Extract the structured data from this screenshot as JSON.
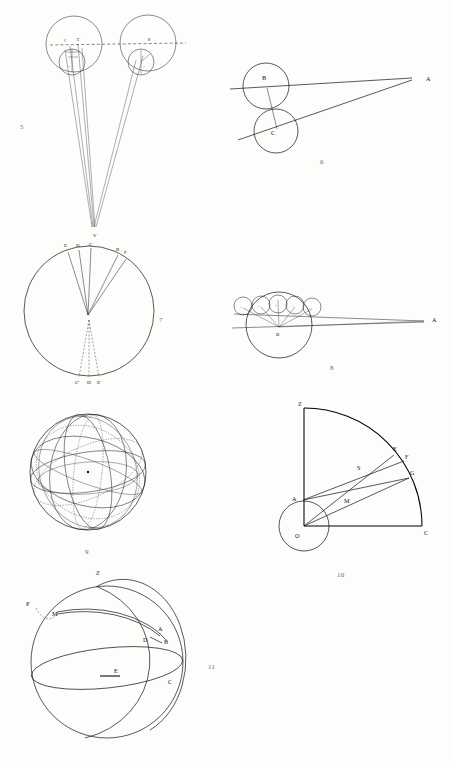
{
  "page": {
    "background_color": "#fdfdfb",
    "ink_color": "#111111",
    "width": 451,
    "height": 761
  },
  "figures": [
    {
      "number": "5",
      "caption": "5",
      "type": "two-epicycle-circles-with-converging-sight-lines",
      "labels": [
        "C",
        "E'",
        "B",
        "D",
        "A"
      ],
      "label_points": [
        {
          "text": "C",
          "x": 65,
          "y": 41
        },
        {
          "text": "E'",
          "x": 79,
          "y": 40
        },
        {
          "text": "B",
          "x": 150,
          "y": 40
        },
        {
          "text": "D",
          "x": 70,
          "y": 66
        },
        {
          "text": "D",
          "x": 145,
          "y": 66
        },
        {
          "text": "A",
          "x": 92,
          "y": 225
        }
      ]
    },
    {
      "number": "6",
      "caption": "6",
      "type": "two-tangent-circles-with-lines-to-external-point",
      "labels": [
        "B",
        "C",
        "A"
      ],
      "label_points": [
        {
          "text": "B",
          "x": 265,
          "y": 78
        },
        {
          "text": "C",
          "x": 274,
          "y": 132
        },
        {
          "text": "A",
          "x": 429,
          "y": 81
        }
      ]
    },
    {
      "number": "7",
      "caption": "7",
      "type": "circle-with-chords-from-interior-point",
      "labels": [
        "V",
        "E",
        "D",
        "C",
        "B",
        "F",
        "C'",
        "D'",
        "E'"
      ],
      "label_points": [
        {
          "text": "V",
          "x": 96,
          "y": 234
        },
        {
          "text": "E",
          "x": 67,
          "y": 246
        },
        {
          "text": "D",
          "x": 79,
          "y": 246
        },
        {
          "text": "C",
          "x": 92,
          "y": 245
        },
        {
          "text": "B",
          "x": 119,
          "y": 250
        },
        {
          "text": "F",
          "x": 127,
          "y": 253
        },
        {
          "text": "C'",
          "x": 78,
          "y": 382
        },
        {
          "text": "D'",
          "x": 90,
          "y": 382
        },
        {
          "text": "E'",
          "x": 100,
          "y": 382
        }
      ]
    },
    {
      "number": "8",
      "caption": "8",
      "type": "large-circle-with-five-small-circles-and-sight-lines",
      "labels": [
        "H",
        "G",
        "D",
        "F",
        "E",
        "B",
        "A"
      ],
      "label_points": [
        {
          "text": "H",
          "x": 240,
          "y": 306
        },
        {
          "text": "G",
          "x": 258,
          "y": 306
        },
        {
          "text": "D",
          "x": 274,
          "y": 306
        },
        {
          "text": "F",
          "x": 290,
          "y": 306
        },
        {
          "text": "E",
          "x": 306,
          "y": 306
        },
        {
          "text": "B",
          "x": 280,
          "y": 332
        },
        {
          "text": "A",
          "x": 434,
          "y": 320
        }
      ]
    },
    {
      "number": "9",
      "caption": "9",
      "type": "armillary-sphere-with-multiple-great-circles",
      "labels": [],
      "label_points": []
    },
    {
      "number": "10",
      "caption": "10",
      "type": "quadrant-with-radii-and-small-circle",
      "labels": [
        "Z",
        "E",
        "F",
        "G",
        "S",
        "A",
        "M",
        "O",
        "C"
      ],
      "label_points": [
        {
          "text": "Z",
          "x": 300,
          "y": 404
        },
        {
          "text": "E",
          "x": 396,
          "y": 449
        },
        {
          "text": "F",
          "x": 408,
          "y": 456
        },
        {
          "text": "G",
          "x": 412,
          "y": 472
        },
        {
          "text": "S",
          "x": 360,
          "y": 467
        },
        {
          "text": "A",
          "x": 294,
          "y": 498
        },
        {
          "text": "M",
          "x": 347,
          "y": 500
        },
        {
          "text": "O",
          "x": 296,
          "y": 536
        },
        {
          "text": "C",
          "x": 424,
          "y": 536
        }
      ]
    },
    {
      "number": "11",
      "caption": "11",
      "type": "celestial-sphere-with-horizon-meridian-and-arcs",
      "labels": [
        "Z",
        "P",
        "M",
        "A",
        "B",
        "D",
        "C",
        "E"
      ],
      "label_points": [
        {
          "text": "Z",
          "x": 99,
          "y": 573
        },
        {
          "text": "P",
          "x": 29,
          "y": 604
        },
        {
          "text": "M",
          "x": 55,
          "y": 613
        },
        {
          "text": "A",
          "x": 160,
          "y": 629
        },
        {
          "text": "B",
          "x": 166,
          "y": 641
        },
        {
          "text": "D",
          "x": 146,
          "y": 639
        },
        {
          "text": "C",
          "x": 170,
          "y": 682
        },
        {
          "text": "E",
          "x": 117,
          "y": 677
        }
      ]
    }
  ],
  "figure_numbers": [
    {
      "text": "5",
      "x": 20,
      "y": 123
    },
    {
      "text": "6",
      "x": 320,
      "y": 158
    },
    {
      "text": "7",
      "x": 159,
      "y": 316
    },
    {
      "text": "8",
      "x": 330,
      "y": 364
    },
    {
      "text": "9",
      "x": 85,
      "y": 548
    },
    {
      "text": "10",
      "x": 337,
      "y": 571
    },
    {
      "text": "11",
      "x": 208,
      "y": 663
    }
  ]
}
